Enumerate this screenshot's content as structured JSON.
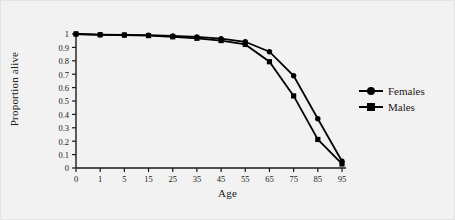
{
  "chart_data": {
    "type": "line",
    "title": "",
    "xlabel": "Age",
    "ylabel": "Proportion alive",
    "categories": [
      "0",
      "1",
      "5",
      "15",
      "25",
      "35",
      "45",
      "55",
      "65",
      "75",
      "85",
      "95"
    ],
    "ylim": [
      0,
      1
    ],
    "y_ticks": [
      "0",
      "0.1",
      "0.2",
      "0.3",
      "0.4",
      "0.5",
      "0.6",
      "0.7",
      "0.8",
      "0.9",
      "1"
    ],
    "y_tick_values": [
      0,
      0.1,
      0.2,
      0.3,
      0.4,
      0.5,
      0.6,
      0.7,
      0.8,
      0.9,
      1
    ],
    "grid": false,
    "legend_position": "right",
    "series": [
      {
        "name": "Females",
        "marker": "circle",
        "color": "#000000",
        "values": [
          1.0,
          0.995,
          0.993,
          0.991,
          0.985,
          0.978,
          0.965,
          0.942,
          0.868,
          0.688,
          0.368,
          0.05
        ]
      },
      {
        "name": "Males",
        "marker": "square",
        "color": "#000000",
        "values": [
          1.0,
          0.994,
          0.992,
          0.988,
          0.979,
          0.968,
          0.951,
          0.922,
          0.793,
          0.538,
          0.213,
          0.03
        ]
      }
    ]
  },
  "figure": {
    "background": "#f2f2f2",
    "axis_color": "#1a1a1a",
    "border_color": "#e4e4e4"
  },
  "legend": {
    "items": [
      {
        "label": "Females",
        "marker": "circle"
      },
      {
        "label": "Males",
        "marker": "square"
      }
    ]
  }
}
